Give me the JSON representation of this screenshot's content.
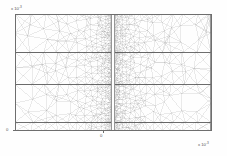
{
  "figure": {
    "type": "fem-mesh-plot",
    "background_color": "#fefefe",
    "line_color": "#9a9a9a",
    "interface_color": "#4a4a4a",
    "axis_color": "#6e6e6e"
  },
  "axes": {
    "y_multiplier_prefix": "x 10",
    "y_multiplier_exponent": "-3",
    "x_multiplier_prefix": "x 10",
    "x_multiplier_exponent": "-3",
    "x_tick_labels": [
      "0"
    ],
    "y_tick_labels": [
      "0"
    ]
  },
  "chart_data": {
    "type": "line",
    "title": "",
    "subtitle": "",
    "xlabel": "",
    "ylabel": "",
    "grid": false,
    "legend": null,
    "axis_multiplier": 0.001,
    "xlim": [
      -4.7,
      4.7
    ],
    "ylim": [
      -3.0,
      3.0
    ],
    "x": [
      -4.7,
      -2.35,
      0,
      2.35,
      4.7
    ],
    "domain_rect": {
      "x_min": -4.7,
      "x_max": 4.7,
      "y_min": -3.0,
      "y_max": 3.0
    },
    "slit": {
      "x": 0.0,
      "y_min": -3.0,
      "y_max": 3.0,
      "half_width": 0.08
    },
    "interface_lines_y": [
      1.05,
      -0.6,
      -2.55
    ],
    "series": [
      {
        "name": "domain boundary",
        "values": [
          3.0,
          3.0,
          3.0,
          3.0,
          3.0
        ]
      },
      {
        "name": "interface 1",
        "values": [
          1.05,
          1.05,
          1.05,
          1.05,
          1.05
        ]
      },
      {
        "name": "interface 2",
        "values": [
          -0.6,
          -0.6,
          -0.6,
          -0.6,
          -0.6
        ]
      },
      {
        "name": "interface 3",
        "values": [
          -2.55,
          -2.55,
          -2.55,
          -2.55,
          -2.55
        ]
      },
      {
        "name": "bottom boundary",
        "values": [
          -3.0,
          -3.0,
          -3.0,
          -3.0,
          -3.0
        ]
      }
    ],
    "mesh_refinement": {
      "min_element_size_rel": 0.004,
      "max_element_size_rel": 0.09,
      "refinement_center_x": 0.0,
      "description": "element size grows geometrically with distance from the slit"
    }
  }
}
